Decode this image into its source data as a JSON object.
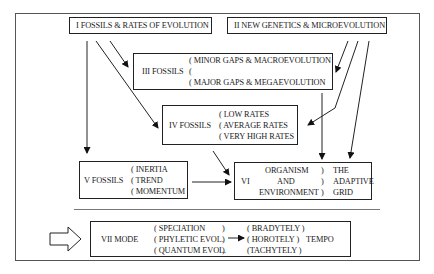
{
  "diagram": {
    "box_i": {
      "label": "I FOSSILS & RATES OF EVOLUTION"
    },
    "box_ii": {
      "label": "II NEW GENETICS & MICROEVOLUTION"
    },
    "box_iii": {
      "label": "III FOSSILS",
      "items": [
        "( MINOR GAPS & MACROEVOLUTION",
        "(",
        "( MAJOR GAPS & MEGAEVOLUTION"
      ]
    },
    "box_iv": {
      "label": "IV FOSSILS",
      "items": [
        "( LOW RATES",
        "( AVERAGE RATES",
        "( VERY HIGH RATES"
      ]
    },
    "box_v": {
      "label": "V FOSSILS",
      "items": [
        "( INERTIA",
        "( TREND",
        "( MOMENTUM"
      ]
    },
    "box_vi": {
      "numeral": "VI",
      "left_items": [
        "ORGANISM",
        "AND",
        "ENVIRONMENT"
      ],
      "parens": [
        ")",
        ")",
        ")"
      ],
      "right_items": [
        "THE",
        "ADAPTIVE",
        "GRID"
      ]
    },
    "box_vii": {
      "label": "VII  MODE",
      "mode_items": [
        "( SPECIATION",
        "( PHYLETIC EVOL.",
        "( QUANTUM EVOL."
      ],
      "mode_parens": [
        ")",
        ")",
        ")"
      ],
      "tempo_items": [
        "( BRADYTELY )",
        "( HOROTELY    )",
        "(TACHYTELY  )"
      ],
      "tempo_label": "TEMPO"
    }
  }
}
